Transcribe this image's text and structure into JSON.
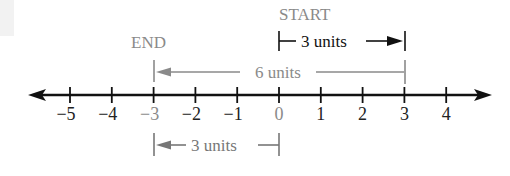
{
  "diagram": {
    "type": "number-line",
    "ticks": [
      -5,
      -4,
      -3,
      -2,
      -1,
      0,
      1,
      2,
      3,
      4
    ],
    "tick_labels": [
      "−5",
      "−4",
      "−3",
      "−2",
      "−1",
      "0",
      "1",
      "2",
      "3",
      "4"
    ],
    "highlighted_ticks": [
      "−3",
      "0"
    ],
    "start_label": "START",
    "end_label": "END",
    "start_value": 0,
    "end_value": -3,
    "top_arrow": {
      "label": "3 units",
      "from": 0,
      "to": 3
    },
    "middle_arrow": {
      "label": "6 units",
      "from": 3,
      "to": -3
    },
    "bottom_arrow": {
      "label": "3 units",
      "from": 0,
      "to": -3
    },
    "colors": {
      "axis": "#111111",
      "gray": "#8a8a8a",
      "dark_label": "#222222"
    }
  }
}
